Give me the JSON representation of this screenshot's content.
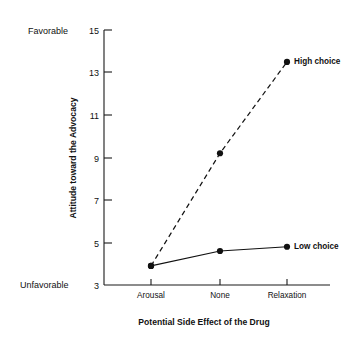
{
  "chart_data": {
    "type": "line",
    "title": "",
    "xlabel": "Potential Side Effect of the Drug",
    "ylabel": "Attitude toward the Advocacy",
    "categories": [
      "Arousal",
      "None",
      "Relaxation"
    ],
    "series": [
      {
        "name": "High choice",
        "values": [
          3.9,
          9.2,
          13.5
        ],
        "style": "dashed"
      },
      {
        "name": "Low choice",
        "values": [
          3.9,
          4.6,
          4.8
        ],
        "style": "solid"
      }
    ],
    "ylim": [
      3,
      15
    ],
    "yticks": [
      3,
      5,
      7,
      9,
      11,
      13,
      15
    ],
    "ytick_labels": [
      "3",
      "5",
      "7",
      "9",
      "11",
      "13",
      "15"
    ],
    "y_axis_high_anchor": "Favorable",
    "y_axis_low_anchor": "Unfavorable",
    "grid": false,
    "legend_position": "inline-right-of-last-point",
    "marker": "filled-circle",
    "line_color": "#111111"
  }
}
